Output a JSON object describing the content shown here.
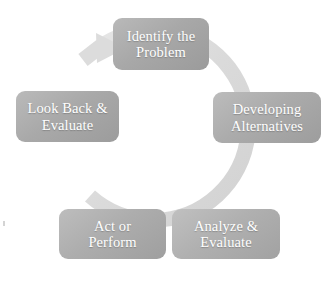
{
  "diagram": {
    "type": "cycle",
    "direction": "clockwise",
    "ring_color": "#dcdcdc",
    "node_fill_light": "#bcbcbc",
    "node_fill_dark": "#9c9c9c",
    "node_text_color": "#ffffff",
    "background": "#ffffff",
    "nodes": [
      {
        "id": "identify-the-problem",
        "position": "top",
        "line1": "Identify the",
        "line2": "Problem"
      },
      {
        "id": "developing-alternatives",
        "position": "right",
        "line1": "Developing",
        "line2": "Alternatives"
      },
      {
        "id": "analyze-and-evaluate",
        "position": "bottom-right",
        "line1": "Analyze &",
        "line2": "Evaluate"
      },
      {
        "id": "act-or-perform",
        "position": "bottom-left",
        "line1": "Act or",
        "line2": "Perform"
      },
      {
        "id": "look-back-and-evaluate",
        "position": "left",
        "line1": "Look Back &",
        "line2": "Evaluate"
      }
    ],
    "arrow": {
      "id": "cycle-arrow",
      "head_position": "top-left",
      "points_to": "identify-the-problem"
    }
  }
}
